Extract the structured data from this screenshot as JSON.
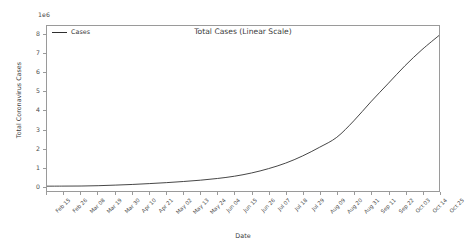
{
  "chart_data": {
    "type": "line",
    "title": "Total Cases (Linear Scale)",
    "xlabel": "Date",
    "ylabel": "Total Coronavirus Cases",
    "y_offset_text": "1e6",
    "y_offset_multiplier": 1000000,
    "grid": false,
    "legend_position": "upper left",
    "line_color": "#2f2f2f",
    "ylim": [
      -0.25,
      8.45
    ],
    "yticks": [
      0,
      1,
      2,
      3,
      4,
      5,
      6,
      7,
      8
    ],
    "ytick_labels": [
      "0",
      "1",
      "2",
      "3",
      "4",
      "5",
      "6",
      "7",
      "8"
    ],
    "categories": [
      "Feb 15",
      "Feb 26",
      "Mar 08",
      "Mar 19",
      "Mar 30",
      "Apr 10",
      "Apr 21",
      "May 02",
      "May 13",
      "May 24",
      "Jun 04",
      "Jun 15",
      "Jun 26",
      "Jul 07",
      "Jul 18",
      "Jul 29",
      "Aug 09",
      "Aug 20",
      "Aug 31",
      "Sep 11",
      "Sep 22",
      "Oct 03",
      "Oct 14",
      "Oct 25"
    ],
    "series": [
      {
        "name": "Cases",
        "values": [
          0.005,
          0.008,
          0.012,
          0.03,
          0.06,
          0.095,
          0.14,
          0.19,
          0.25,
          0.32,
          0.41,
          0.53,
          0.7,
          0.93,
          1.22,
          1.6,
          2.06,
          2.58,
          3.45,
          4.45,
          5.4,
          6.35,
          7.2,
          7.95
        ]
      }
    ]
  },
  "legend": {
    "entries": [
      {
        "label": "Cases"
      }
    ]
  }
}
